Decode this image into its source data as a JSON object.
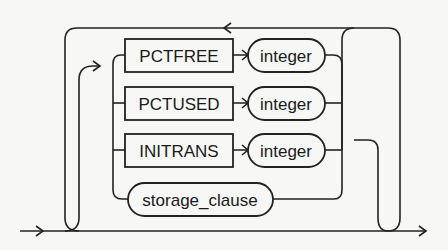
{
  "diagram": {
    "type": "railroad-syntax-diagram",
    "keywords": [
      {
        "label": "PCTFREE",
        "argument": "integer"
      },
      {
        "label": "PCTUSED",
        "argument": "integer"
      },
      {
        "label": "INITRANS",
        "argument": "integer"
      }
    ],
    "clause": {
      "label": "storage_clause"
    },
    "colors": {
      "line": "#222222",
      "background": "#f7f7f5"
    }
  }
}
